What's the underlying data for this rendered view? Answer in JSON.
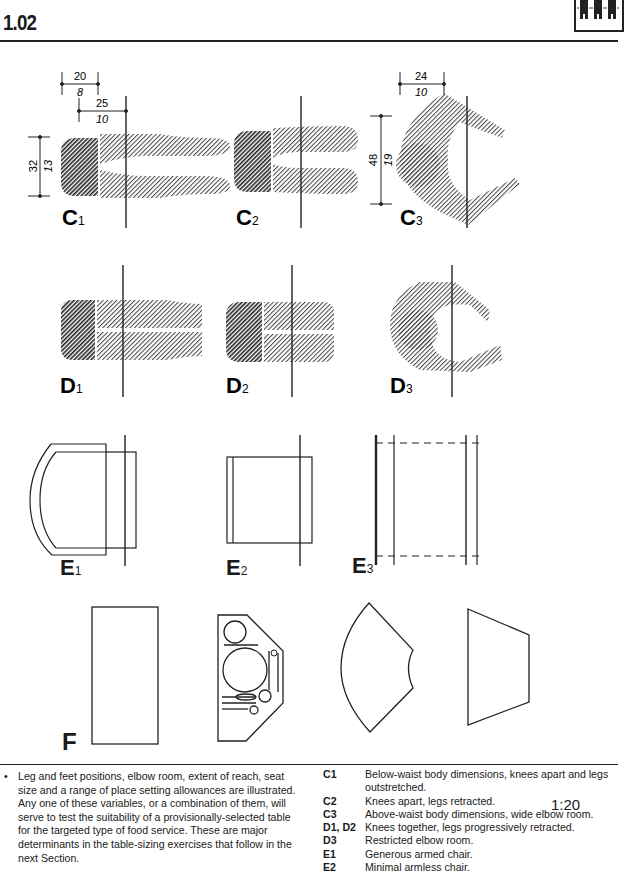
{
  "header": {
    "page_number": "1.02",
    "logo_icon": "three-seated-figures-icon"
  },
  "figures": {
    "row_c": [
      {
        "id": "C1",
        "letter": "C",
        "sub": "1",
        "dims": [
          {
            "metric": "20",
            "imperial": "8",
            "orientation": "horizontal"
          },
          {
            "metric": "25",
            "imperial": "10",
            "orientation": "horizontal"
          },
          {
            "metric": "32",
            "imperial": "13",
            "orientation": "vertical"
          }
        ]
      },
      {
        "id": "C2",
        "letter": "C",
        "sub": "2",
        "dims": []
      },
      {
        "id": "C3",
        "letter": "C",
        "sub": "3",
        "dims": [
          {
            "metric": "24",
            "imperial": "10",
            "orientation": "horizontal"
          },
          {
            "metric": "48",
            "imperial": "19",
            "orientation": "vertical"
          }
        ]
      }
    ],
    "row_d": [
      {
        "id": "D1",
        "letter": "D",
        "sub": "1"
      },
      {
        "id": "D2",
        "letter": "D",
        "sub": "2"
      },
      {
        "id": "D3",
        "letter": "D",
        "sub": "3"
      }
    ],
    "row_e": [
      {
        "id": "E1",
        "letter": "E",
        "sub": "1"
      },
      {
        "id": "E2",
        "letter": "E",
        "sub": "2"
      },
      {
        "id": "E3",
        "letter": "E",
        "sub": "3"
      }
    ],
    "row_f": {
      "id": "F",
      "letter": "F",
      "shapes": [
        "rectangle",
        "place-setting",
        "sector",
        "trapezoid"
      ]
    }
  },
  "scale": "1:20",
  "notes": {
    "bullet": "•",
    "text": "Leg and feet positions, elbow room, extent of reach, seat size and a range of place setting allowances are illustrated. Any one of these variables, or a combination of them, will serve to test the suitability of a provisionally-selected table for the targeted type of food service. These are major determinants in the table-sizing exercises that follow in the next Section."
  },
  "legend": [
    {
      "code": "C1",
      "desc": "Below-waist body dimensions, knees apart and legs outstretched."
    },
    {
      "code": "C2",
      "desc": "Knees apart, legs retracted."
    },
    {
      "code": "C3",
      "desc": "Above-waist body dimensions, wide elbow room."
    },
    {
      "code": "D1, D2",
      "desc": "Knees together, legs progressively retracted."
    },
    {
      "code": "D3",
      "desc": "Restricted elbow room."
    },
    {
      "code": "E1",
      "desc": "Generous armed chair."
    },
    {
      "code": "E2",
      "desc": "Minimal armless chair."
    }
  ]
}
